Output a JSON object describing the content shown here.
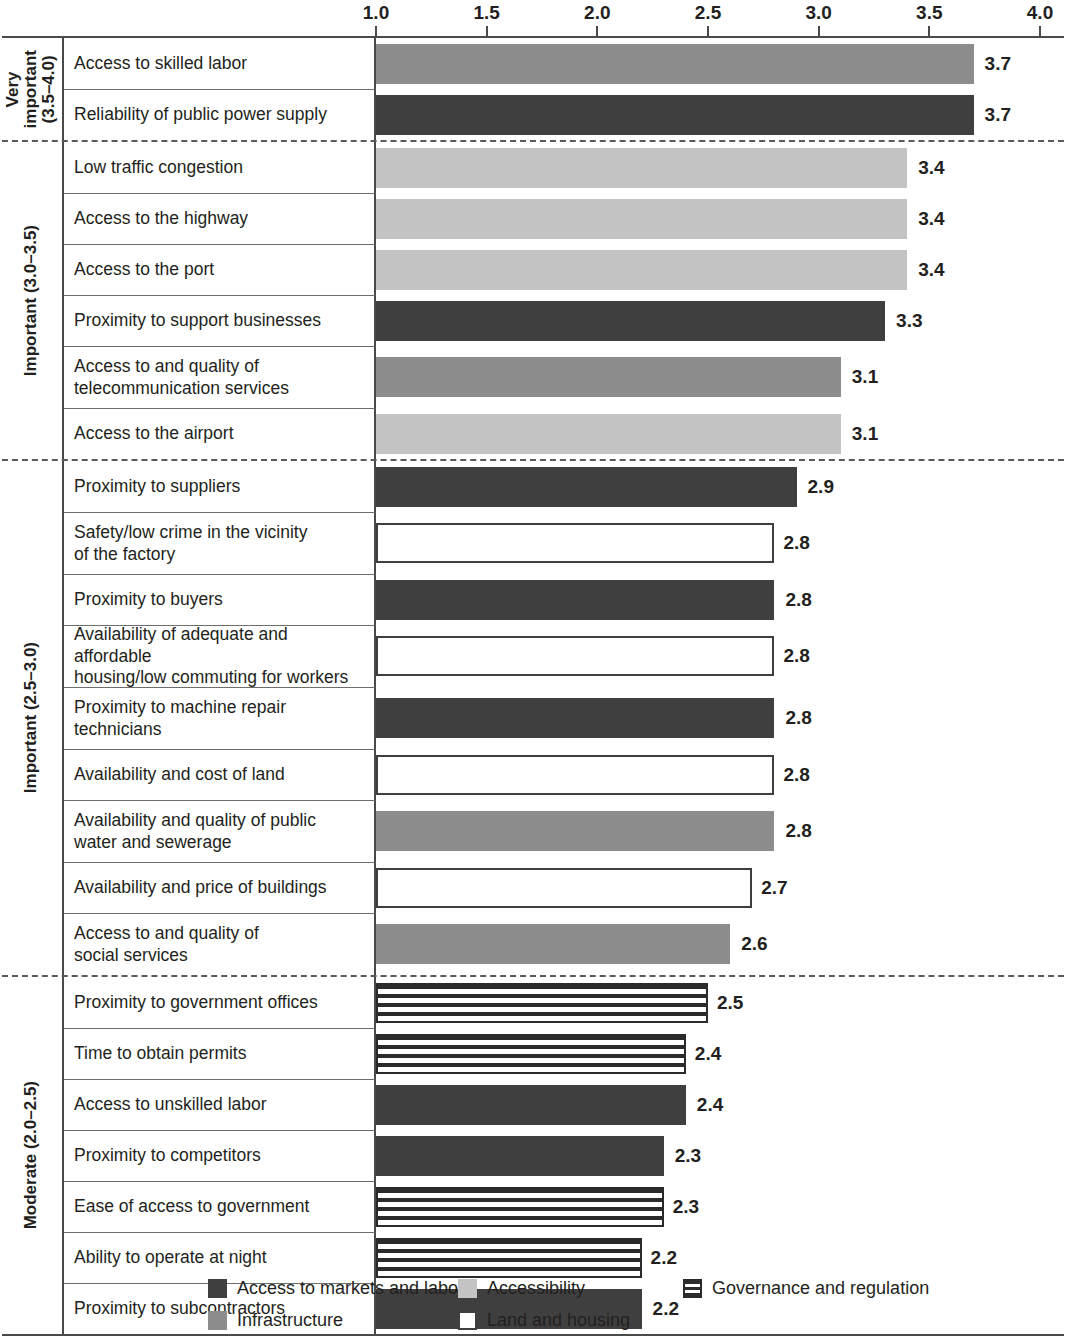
{
  "chart_data": {
    "type": "bar",
    "orientation": "horizontal",
    "title": "",
    "xlabel": "",
    "ylabel": "",
    "xlim": [
      1.0,
      4.0
    ],
    "xticks": [
      "1.0",
      "1.5",
      "2.0",
      "2.5",
      "3.0",
      "3.5",
      "4.0"
    ],
    "xtick_values": [
      1.0,
      1.5,
      2.0,
      2.5,
      3.0,
      3.5,
      4.0
    ],
    "grid": false,
    "legend_position": "bottom",
    "categories": [
      "Access to skilled labor",
      "Reliability of public power supply",
      "Low traffic congestion",
      "Access to the highway",
      "Access to the port",
      "Proximity to support businesses",
      "Access to and quality of telecommunication services",
      "Access to the airport",
      "Proximity to suppliers",
      "Safety/low crime in the vicinity of the factory",
      "Proximity to buyers",
      "Availability of adequate and affordable housing/low commuting for workers",
      "Proximity to machine repair technicians",
      "Availability and cost of land",
      "Availability and quality of public water and sewerage",
      "Availability and price of buildings",
      "Access to and quality of social services",
      "Proximity to government offices",
      "Time to obtain permits",
      "Access to unskilled labor",
      "Proximity to competitors",
      "Ease of access to government",
      "Ability to operate at night",
      "Proximity to subcontractors"
    ],
    "values": [
      3.7,
      3.7,
      3.4,
      3.4,
      3.4,
      3.3,
      3.1,
      3.1,
      2.9,
      2.8,
      2.8,
      2.8,
      2.8,
      2.8,
      2.8,
      2.7,
      2.6,
      2.5,
      2.4,
      2.4,
      2.3,
      2.3,
      2.2,
      2.2
    ],
    "series_by_legend_category": [
      "infrastructure",
      "markets",
      "accessibility",
      "accessibility",
      "accessibility",
      "markets",
      "infrastructure",
      "accessibility",
      "markets",
      "land",
      "markets",
      "land",
      "markets",
      "land",
      "infrastructure",
      "land",
      "infrastructure",
      "governance",
      "governance",
      "markets",
      "markets",
      "governance",
      "governance",
      "markets"
    ]
  },
  "axis": {
    "ticks": [
      {
        "label": "1.0",
        "value": 1.0
      },
      {
        "label": "1.5",
        "value": 1.5
      },
      {
        "label": "2.0",
        "value": 2.0
      },
      {
        "label": "2.5",
        "value": 2.5
      },
      {
        "label": "3.0",
        "value": 3.0
      },
      {
        "label": "3.5",
        "value": 3.5
      },
      {
        "label": "4.0",
        "value": 4.0
      }
    ]
  },
  "groups": [
    {
      "label": "Very\nimportant\n(3.5–4.0)",
      "divider_below": "dashed",
      "rows": [
        {
          "name": "Access to skilled labor",
          "value": 3.7,
          "value_label": "3.7",
          "category": "infrastructure"
        },
        {
          "name": "Reliability of public power supply",
          "value": 3.7,
          "value_label": "3.7",
          "category": "markets"
        }
      ]
    },
    {
      "label": "Important (3.0–3.5)",
      "divider_below": "dashed",
      "rows": [
        {
          "name": "Low traffic congestion",
          "value": 3.4,
          "value_label": "3.4",
          "category": "accessibility"
        },
        {
          "name": "Access to the highway",
          "value": 3.4,
          "value_label": "3.4",
          "category": "accessibility"
        },
        {
          "name": "Access to the port",
          "value": 3.4,
          "value_label": "3.4",
          "category": "accessibility"
        },
        {
          "name": "Proximity to support businesses",
          "value": 3.3,
          "value_label": "3.3",
          "category": "markets"
        },
        {
          "name": "Access to and quality of\ntelecommunication services",
          "value": 3.1,
          "value_label": "3.1",
          "category": "infrastructure"
        },
        {
          "name": "Access to the airport",
          "value": 3.1,
          "value_label": "3.1",
          "category": "accessibility"
        }
      ]
    },
    {
      "label": "Important (2.5–3.0)",
      "divider_below": "dashed",
      "rows": [
        {
          "name": "Proximity to suppliers",
          "value": 2.9,
          "value_label": "2.9",
          "category": "markets"
        },
        {
          "name": "Safety/low crime in the vicinity\nof the factory",
          "value": 2.8,
          "value_label": "2.8",
          "category": "land"
        },
        {
          "name": "Proximity to buyers",
          "value": 2.8,
          "value_label": "2.8",
          "category": "markets"
        },
        {
          "name": "Availability of adequate and affordable\nhousing/low commuting for workers",
          "value": 2.8,
          "value_label": "2.8",
          "category": "land"
        },
        {
          "name": "Proximity to machine repair\ntechnicians",
          "value": 2.8,
          "value_label": "2.8",
          "category": "markets"
        },
        {
          "name": "Availability and cost of land",
          "value": 2.8,
          "value_label": "2.8",
          "category": "land"
        },
        {
          "name": "Availability and quality of public\nwater and sewerage",
          "value": 2.8,
          "value_label": "2.8",
          "category": "infrastructure"
        },
        {
          "name": "Availability and price of buildings",
          "value": 2.7,
          "value_label": "2.7",
          "category": "land"
        },
        {
          "name": "Access to and quality of\nsocial services",
          "value": 2.6,
          "value_label": "2.6",
          "category": "infrastructure"
        }
      ]
    },
    {
      "label": "Moderate (2.0–2.5)",
      "divider_below": "solid",
      "rows": [
        {
          "name": "Proximity to government offices",
          "value": 2.5,
          "value_label": "2.5",
          "category": "governance"
        },
        {
          "name": "Time to obtain permits",
          "value": 2.4,
          "value_label": "2.4",
          "category": "governance"
        },
        {
          "name": "Access to unskilled labor",
          "value": 2.4,
          "value_label": "2.4",
          "category": "markets"
        },
        {
          "name": "Proximity to competitors",
          "value": 2.3,
          "value_label": "2.3",
          "category": "markets"
        },
        {
          "name": "Ease of access to government",
          "value": 2.3,
          "value_label": "2.3",
          "category": "governance"
        },
        {
          "name": "Ability to operate at night",
          "value": 2.2,
          "value_label": "2.2",
          "category": "governance"
        },
        {
          "name": "Proximity to subcontractors",
          "value": 2.2,
          "value_label": "2.2",
          "category": "markets"
        }
      ]
    }
  ],
  "legend": {
    "columns": [
      [
        {
          "key": "markets",
          "label": "Access to markets and labor"
        },
        {
          "key": "infrastructure",
          "label": "Infrastructure"
        }
      ],
      [
        {
          "key": "accessibility",
          "label": "Accessibility"
        },
        {
          "key": "land",
          "label": "Land and housing"
        }
      ],
      [
        {
          "key": "governance",
          "label": "Governance and regulation"
        }
      ]
    ]
  },
  "colors": {
    "markets": "#3f3f3f",
    "infrastructure": "#8d8d8d",
    "accessibility": "#c4c4c4",
    "land": "#ffffff",
    "governance": "#2b2b2b",
    "text": "#231f20",
    "rule": "#4a4a4a"
  }
}
